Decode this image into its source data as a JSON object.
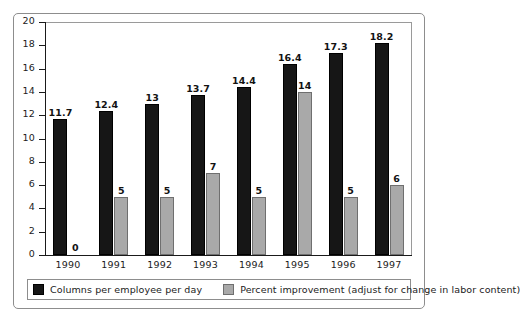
{
  "chart_data": {
    "type": "bar",
    "title": "",
    "subtitle": "",
    "xlabel": "",
    "ylabel": "",
    "ylim": [
      0,
      20
    ],
    "yticks": [
      0,
      2,
      4,
      6,
      8,
      10,
      12,
      14,
      16,
      18,
      20
    ],
    "ytick_labels": [
      "0",
      "2",
      "4",
      "6",
      "8",
      "10",
      "12",
      "14",
      "16",
      "18",
      "20"
    ],
    "grid": false,
    "legend_position": "bottom",
    "categories": [
      "1990",
      "1991",
      "1992",
      "1993",
      "1994",
      "1995",
      "1996",
      "1997"
    ],
    "series": [
      {
        "name": "Columns per employee per day",
        "color": "#161616",
        "values": [
          11.7,
          12.4,
          13,
          13.7,
          14.4,
          16.4,
          17.3,
          18.2
        ],
        "labels": [
          "11.7",
          "12.4",
          "13",
          "13.7",
          "14.4",
          "16.4",
          "17.3",
          "18.2"
        ]
      },
      {
        "name": "Percent improvement (adjust for change in labor content)",
        "color": "#a9a9a9",
        "values": [
          0,
          5,
          5,
          7,
          5,
          14,
          5,
          6
        ],
        "labels": [
          "0",
          "5",
          "5",
          "7",
          "5",
          "14",
          "5",
          "6"
        ]
      }
    ]
  },
  "legend": {
    "entries": [
      {
        "label": "Columns per employee per day",
        "swatch": "dark-swatch"
      },
      {
        "label": "Percent improvement (adjust for change in labor content)",
        "swatch": "gray-swatch"
      }
    ]
  }
}
